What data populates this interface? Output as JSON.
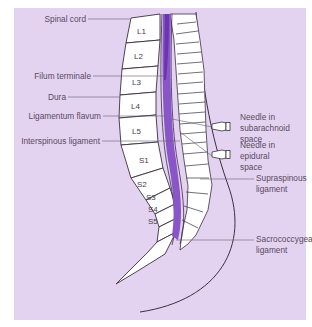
{
  "figure": {
    "type": "anatomical diagram",
    "colors": {
      "background": "#e3d3f1",
      "csf_space": "#8a55c8",
      "bone": "#ffffff",
      "outline": "#3a3040",
      "leader": "#6a5a70"
    }
  },
  "labels_left": [
    {
      "text": "Spinal cord"
    },
    {
      "text": "Filum terminale"
    },
    {
      "text": "Dura"
    },
    {
      "text": "Ligamentum flavum"
    },
    {
      "text": "Interspinous ligament"
    }
  ],
  "labels_right": [
    {
      "line1": "Needle in",
      "line2": "subarachnoid",
      "line3": "space"
    },
    {
      "line1": "Needle in",
      "line2": "epidural",
      "line3": "space"
    },
    {
      "line1": "Supraspinous",
      "line2": "ligament"
    },
    {
      "line1": "Sacrococcygeal",
      "line2": "ligament"
    }
  ],
  "vertebrae": [
    "L1",
    "L2",
    "L3",
    "L4",
    "L5",
    "S1",
    "S2",
    "S3",
    "S4",
    "S5"
  ]
}
